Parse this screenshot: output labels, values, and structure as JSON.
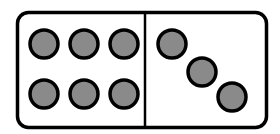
{
  "scene": {
    "title": "Domino tile",
    "background_color": "#ffffff",
    "width": 280,
    "height": 134
  },
  "domino": {
    "name": "domino-tile",
    "shape": "rounded-rectangle",
    "x": 17.5,
    "y": 12.5,
    "width": 249,
    "height": 115,
    "corner_radius": 11,
    "fill_color": "#ffffff",
    "stroke_color": "#000000",
    "stroke_width": 3.5,
    "total_pips": 9,
    "notation": "6-3"
  },
  "divider": {
    "name": "center-divider-line",
    "x": 145,
    "y1": 12.5,
    "y2": 127.5,
    "stroke_color": "#000000",
    "stroke_width": 2.5
  },
  "pip_style": {
    "radius": 14,
    "fill_color": "#8a8a8a",
    "stroke_color": "#000000",
    "stroke_width": 3.5
  },
  "halves": [
    {
      "name": "left-half",
      "value": 6,
      "value_label": "6",
      "arrangement": "3x2-grid",
      "pips": [
        {
          "id": "left-pip-1",
          "cx": 44,
          "cy": 44
        },
        {
          "id": "left-pip-2",
          "cx": 84,
          "cy": 44
        },
        {
          "id": "left-pip-3",
          "cx": 124,
          "cy": 44
        },
        {
          "id": "left-pip-4",
          "cx": 44,
          "cy": 94
        },
        {
          "id": "left-pip-5",
          "cx": 84,
          "cy": 94
        },
        {
          "id": "left-pip-6",
          "cx": 124,
          "cy": 94
        }
      ]
    },
    {
      "name": "right-half",
      "value": 3,
      "value_label": "3",
      "arrangement": "diagonal",
      "pips": [
        {
          "id": "right-pip-1",
          "cx": 172,
          "cy": 44
        },
        {
          "id": "right-pip-2",
          "cx": 202,
          "cy": 72
        },
        {
          "id": "right-pip-3",
          "cx": 232,
          "cy": 97
        }
      ]
    }
  ]
}
